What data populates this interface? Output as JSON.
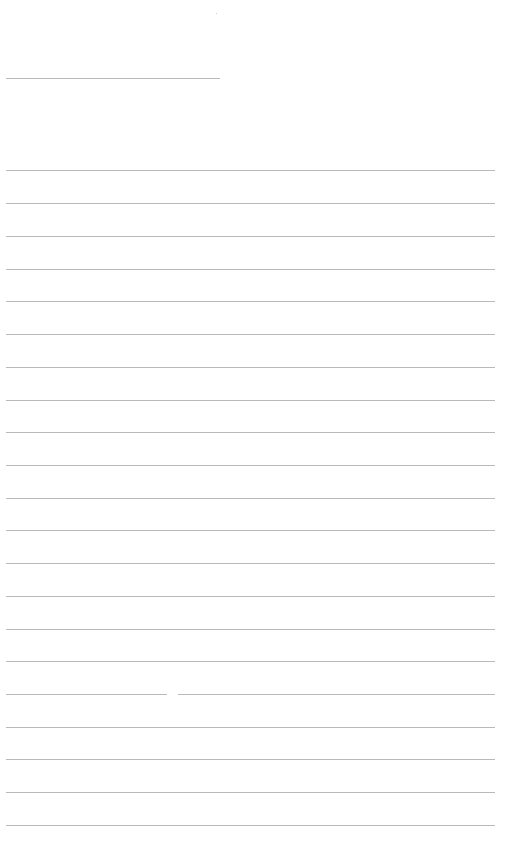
{
  "document": {
    "type": "lined-paper",
    "line_color": "#b9b9b9",
    "background": "#ffffff",
    "header_line": {
      "top": 78,
      "left": 6,
      "width": 214
    },
    "body_lines": {
      "left": 6,
      "width": 489,
      "tops": [
        170,
        203,
        236,
        269,
        301,
        334,
        367,
        400,
        432,
        465,
        498,
        530,
        563,
        596,
        629,
        661,
        694,
        727,
        759,
        792,
        825
      ]
    },
    "line_breaks": [
      {
        "line_index": 16,
        "left": 167,
        "width": 11
      }
    ]
  }
}
